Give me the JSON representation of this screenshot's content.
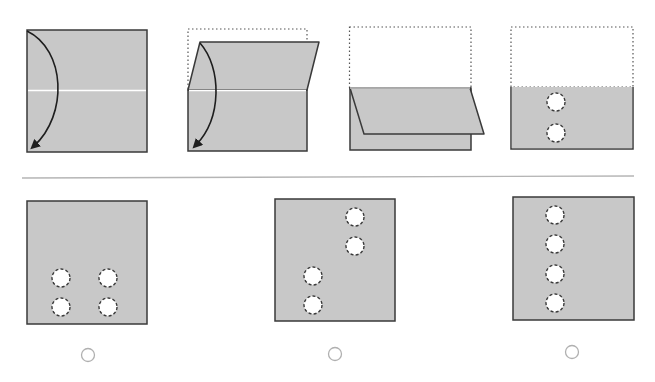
{
  "colors": {
    "paper": "#c8c8c8",
    "outline": "#3a3a3a",
    "crease": "#ffffff",
    "dotted": "#555555",
    "hole_fill": "#ffffff",
    "hole_stroke": "#3a3a3a",
    "separator": "#b5b5b5",
    "radio_stroke": "#b0b0b0"
  },
  "question": {
    "steps": [
      {
        "id": "step-1",
        "description": "Square sheet with horizontal crease; arrow shows fold top edge down to bottom"
      },
      {
        "id": "step-2",
        "description": "Top half folding down along crease; dotted outline shows original position"
      },
      {
        "id": "step-3",
        "description": "Sheet folded in half; top flap lies over bottom half"
      },
      {
        "id": "step-4",
        "description": "Folded sheet with two punched holes in a vertical column"
      }
    ],
    "punched_holes": [
      [
        556,
        102
      ],
      [
        556,
        133
      ]
    ]
  },
  "options": [
    {
      "id": "option-a",
      "label": "Option A",
      "holes": [
        [
          61,
          278
        ],
        [
          108,
          278
        ],
        [
          61,
          307
        ],
        [
          108,
          307
        ]
      ],
      "selected": false
    },
    {
      "id": "option-b",
      "label": "Option B",
      "holes": [
        [
          355,
          217
        ],
        [
          355,
          246
        ],
        [
          313,
          276
        ],
        [
          313,
          305
        ]
      ],
      "selected": false
    },
    {
      "id": "option-c",
      "label": "Option C",
      "holes": [
        [
          555,
          215
        ],
        [
          555,
          244
        ],
        [
          555,
          274
        ],
        [
          555,
          303
        ]
      ],
      "selected": false
    }
  ]
}
